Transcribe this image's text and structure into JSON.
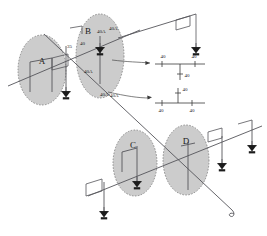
{
  "diagram": {
    "zones": [
      {
        "id": "A",
        "label": "A",
        "cx": 42,
        "cy": 70,
        "rx": 24,
        "ry": 35
      },
      {
        "id": "B",
        "label": "B",
        "cx": 100,
        "cy": 56,
        "rx": 24,
        "ry": 42
      },
      {
        "id": "C",
        "label": "C",
        "cx": 135,
        "cy": 163,
        "rx": 22,
        "ry": 33
      },
      {
        "id": "D",
        "label": "D",
        "cx": 186,
        "cy": 160,
        "rx": 23,
        "ry": 35
      }
    ],
    "ratings": [
      {
        "text": "40A",
        "x": 86,
        "y": 35
      },
      {
        "text": "40A",
        "x": 95,
        "y": 34
      },
      {
        "text": "35",
        "x": 69,
        "y": 46
      },
      {
        "text": "40",
        "x": 82,
        "y": 43
      },
      {
        "text": "40A",
        "x": 89,
        "y": 71
      },
      {
        "text": "40A",
        "x": 105,
        "y": 95
      },
      {
        "text": "40A",
        "x": 111,
        "y": 96
      }
    ],
    "insets": [
      {
        "name": "inset-top",
        "labels": [
          {
            "text": "40",
            "x": 163,
            "y": 57
          },
          {
            "text": "40",
            "x": 193,
            "y": 57
          },
          {
            "text": "40",
            "x": 183,
            "y": 75
          }
        ]
      },
      {
        "name": "inset-bottom",
        "labels": [
          {
            "text": "40",
            "x": 183,
            "y": 91
          },
          {
            "text": "40",
            "x": 160,
            "y": 110
          },
          {
            "text": "40",
            "x": 190,
            "y": 110
          }
        ]
      }
    ],
    "colors": {
      "zone_fill": "#b9b9b9",
      "zone_stroke": "#6b6b6b",
      "line": "#55555a",
      "text": "#1a1a1a"
    }
  }
}
